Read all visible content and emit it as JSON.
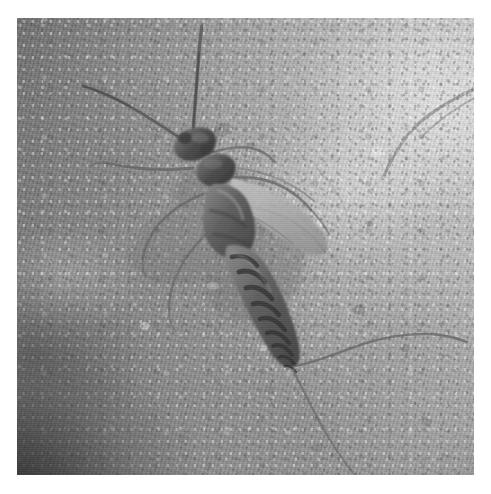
{
  "image": {
    "kind": "photograph",
    "medium": "grayscale-photograph",
    "subject": "stonefly nymph (aquatic insect) resting on a pale rock surface",
    "orientation": "square",
    "alt_text": "Black and white close-up photograph of a stonefly nymph with long antennae, banded abdomen and two long tail filaments, resting on a mottled light-gray rock.",
    "border": {
      "present": true,
      "color": "#ffffff",
      "left_px": 17,
      "top_px": 18,
      "right_px": 17,
      "bottom_px": 19
    },
    "photo_size": {
      "width_px": 457,
      "height_px": 457
    },
    "canvas_size": {
      "width_px": 491,
      "height_px": 494
    }
  },
  "palette": {
    "page_background": "#ffffff",
    "rock_highlight": "#f2f2f2",
    "rock_light": "#dedede",
    "rock_mid": "#c2c2c2",
    "rock_dark": "#9a9a9a",
    "corner_shadow": "#3b3b3b",
    "insect_body_dark": "#4a4a4a",
    "insect_body_mid": "#6e6e6e",
    "insect_body_light": "#8f8f8f",
    "insect_band": "#3e3e3e",
    "filament": "#6a6a6a"
  },
  "scene": {
    "background_name": "rock-surface",
    "background_description": "pale mottled granular stone, brightly lit from the upper right, with a deep shadow sweeping into the lower-left corner",
    "lighting": "diffuse daylight from upper right",
    "shadow_corner": "lower-left"
  },
  "subject": {
    "common_name": "stonefly nymph",
    "body_axis": "head upper-left, abdomen trailing to lower-right",
    "parts": [
      {
        "name": "antenna-left",
        "label": "left antenna",
        "description": "long slender filament sweeping up and to the left"
      },
      {
        "name": "antenna-right",
        "label": "right antenna",
        "description": "long slender filament rising nearly vertically"
      },
      {
        "name": "head",
        "label": "head",
        "description": "rounded dark capsule at the front"
      },
      {
        "name": "pronotum",
        "label": "pronotum",
        "description": "dark rounded plate behind the head"
      },
      {
        "name": "thorax",
        "label": "thorax",
        "description": "segmented dark mid-body bearing the wing pads and legs"
      },
      {
        "name": "wing-pads",
        "label": "wing pads",
        "description": "pair of pale elongated pads angled back to the right"
      },
      {
        "name": "abdomen",
        "label": "banded abdomen",
        "description": "tapering abdomen with about nine dark cross-bands"
      },
      {
        "name": "legs-left",
        "label": "left legs",
        "description": "three thin legs reaching out to the left"
      },
      {
        "name": "legs-right",
        "label": "right legs",
        "description": "three thin legs reaching out to the right"
      },
      {
        "name": "cercus-upper",
        "label": "upper tail filament",
        "description": "cercus sweeping to the right, slightly upward"
      },
      {
        "name": "cercus-lower",
        "label": "lower tail filament",
        "description": "cercus curving down and to the right toward the frame edge"
      }
    ],
    "abdominal_bands": 9
  },
  "overlays": {
    "text": [],
    "annotations": [],
    "ui_controls": []
  }
}
